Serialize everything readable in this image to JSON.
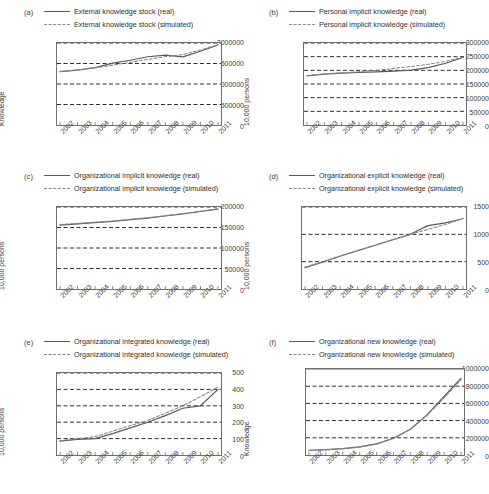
{
  "figure": {
    "panel_count": 6,
    "line_color_real": "#5a5a5a",
    "line_color_simulated": "#8a8a8a",
    "grid_color": "#2f2f2f",
    "axis_color": "#6e6e6e"
  },
  "panels": [
    {
      "label": "(a)",
      "legend": [
        {
          "style": "solid",
          "text": "External knowledge stock (real)"
        },
        {
          "style": "dashed",
          "text": "External knowledge stock (simulated)"
        }
      ],
      "chart_data": {
        "type": "line",
        "title": "External knowledge stock",
        "xlabel": "",
        "ylabel": "Knowledge",
        "x": [
          "2002",
          "2003",
          "2004",
          "2005",
          "2006",
          "2007",
          "2008",
          "2009",
          "2010",
          "2011"
        ],
        "xlim": [
          2002,
          2011
        ],
        "ylim": [
          0,
          2000000
        ],
        "yticks": [
          0,
          500000,
          1000000,
          1500000,
          2000000
        ],
        "ytick_labels": [
          "0",
          "500000",
          "1000000",
          "1500000",
          "2000000"
        ],
        "grid": true,
        "legend_position": "top",
        "series": [
          {
            "name": "External knowledge stock (real)",
            "style": "solid",
            "values": [
              1300000,
              1340000,
              1400000,
              1510000,
              1580000,
              1665000,
              1705000,
              1660000,
              1800000,
              1950000
            ]
          },
          {
            "name": "External knowledge stock (simulated)",
            "style": "dashed",
            "values": [
              1305000,
              1345000,
              1395000,
              1460000,
              1530000,
              1600000,
              1665000,
              1720000,
              1830000,
              1960000
            ]
          }
        ]
      }
    },
    {
      "label": "(b)",
      "legend": [
        {
          "style": "solid",
          "text": "Personal implicit knowledge (real)"
        },
        {
          "style": "dashed",
          "text": "Personal implicit knowledge (simulated)"
        }
      ],
      "chart_data": {
        "type": "line",
        "title": "Personal implicit knowledge",
        "xlabel": "",
        "ylabel": "10,000 persons",
        "x": [
          "2002",
          "2003",
          "2004",
          "2005",
          "2006",
          "2007",
          "2008",
          "2009",
          "2010",
          "2011"
        ],
        "xlim": [
          2002,
          2011
        ],
        "ylim": [
          0,
          300000
        ],
        "yticks": [
          0,
          50000,
          100000,
          150000,
          200000,
          250000,
          300000
        ],
        "ytick_labels": [
          "0",
          "50000",
          "100000",
          "150000",
          "200000",
          "250000",
          "300000"
        ],
        "grid": true,
        "legend_position": "top",
        "series": [
          {
            "name": "Personal implicit knowledge (real)",
            "style": "solid",
            "values": [
              180000,
              186000,
              190000,
              192000,
              194000,
              197000,
              201000,
              210000,
              226000,
              247000
            ]
          },
          {
            "name": "Personal implicit knowledge (simulated)",
            "style": "dashed",
            "values": [
              181000,
              187000,
              191000,
              195000,
              200000,
              207000,
              214000,
              222000,
              233000,
              248000
            ]
          }
        ]
      }
    },
    {
      "label": "(c)",
      "legend": [
        {
          "style": "solid",
          "text": "Organizational implicit knowledge (real)"
        },
        {
          "style": "dashed",
          "text": "Organizational implicit knowledge (simulated)"
        }
      ],
      "chart_data": {
        "type": "line",
        "title": "Organizational implicit knowledge",
        "xlabel": "",
        "ylabel": "10,000 persons",
        "x": [
          "2002",
          "2003",
          "2004",
          "2005",
          "2006",
          "2007",
          "2008",
          "2009",
          "2010",
          "2011"
        ],
        "xlim": [
          2002,
          2011
        ],
        "ylim": [
          0,
          200000
        ],
        "yticks": [
          0,
          50000,
          100000,
          150000,
          200000
        ],
        "ytick_labels": [
          "0",
          "50000",
          "100000",
          "150000",
          "200000"
        ],
        "grid": true,
        "legend_position": "top",
        "series": [
          {
            "name": "Organizational implicit knowledge (real)",
            "style": "solid",
            "values": [
              156000,
              159000,
              162000,
              165000,
              169000,
              173000,
              178000,
              183000,
              189000,
              195000
            ]
          },
          {
            "name": "Organizational implicit knowledge (simulated)",
            "style": "dashed",
            "values": [
              157000,
              160000,
              163000,
              166000,
              170000,
              174000,
              179000,
              184000,
              190000,
              196000
            ]
          }
        ]
      }
    },
    {
      "label": "(d)",
      "legend": [
        {
          "style": "solid",
          "text": "Organizational explicit knowledge (real)"
        },
        {
          "style": "dashed",
          "text": "Organizational explicit knowledge (simulated)"
        }
      ],
      "chart_data": {
        "type": "line",
        "title": "Organizational explicit knowledge",
        "xlabel": "",
        "ylabel": "10,000 persons",
        "x": [
          "2002",
          "2003",
          "2004",
          "2005",
          "2006",
          "2007",
          "2008",
          "2009",
          "2010",
          "2011"
        ],
        "xlim": [
          2002,
          2011
        ],
        "ylim": [
          0,
          1500
        ],
        "yticks": [
          0,
          500,
          1000,
          1500
        ],
        "ytick_labels": [
          "0",
          "500",
          "1000",
          "1500"
        ],
        "grid": true,
        "legend_position": "top",
        "series": [
          {
            "name": "Organizational explicit knowledge (real)",
            "style": "solid",
            "values": [
              390,
              490,
              600,
              700,
              800,
              900,
              1000,
              1160,
              1210,
              1285
            ]
          },
          {
            "name": "Organizational explicit knowledge (simulated)",
            "style": "dashed",
            "values": [
              400,
              500,
              605,
              705,
              805,
              900,
              1000,
              1090,
              1180,
              1290
            ]
          }
        ]
      }
    },
    {
      "label": "(e)",
      "legend": [
        {
          "style": "solid",
          "text": "Organizational integrated knowledge (real)"
        },
        {
          "style": "dashed",
          "text": "Organizational integrated knowledge (simulated)"
        }
      ],
      "chart_data": {
        "type": "line",
        "title": "Organizational integrated knowledge",
        "xlabel": "",
        "ylabel": "10,000 persons",
        "x": [
          "2002",
          "2003",
          "2004",
          "2005",
          "2006",
          "2007",
          "2008",
          "2009",
          "2010",
          "2011"
        ],
        "xlim": [
          2002,
          2011
        ],
        "ylim": [
          0,
          500
        ],
        "yticks": [
          0,
          100,
          200,
          300,
          400,
          500
        ],
        "ytick_labels": [
          "0",
          "100",
          "200",
          "300",
          "400",
          "500"
        ],
        "grid": true,
        "legend_position": "top",
        "series": [
          {
            "name": "Organizational integrated knowledge (real)",
            "style": "solid",
            "values": [
              85,
              95,
              100,
              130,
              165,
              200,
              240,
              285,
              300,
              400
            ]
          },
          {
            "name": "Organizational integrated knowledge (simulated)",
            "style": "dashed",
            "values": [
              88,
              100,
              112,
              145,
              180,
              210,
              255,
              300,
              355,
              415
            ]
          }
        ]
      }
    },
    {
      "label": "(f)",
      "legend": [
        {
          "style": "solid",
          "text": "Organizational new knowledge (real)"
        },
        {
          "style": "dashed",
          "text": "Organizational new knowledge (simulated)"
        }
      ],
      "chart_data": {
        "type": "line",
        "title": "Organizational new knowledge",
        "xlabel": "",
        "ylabel": "Knowledge",
        "x": [
          "2002",
          "2003",
          "2004",
          "2005",
          "2006",
          "2007",
          "2008",
          "2009",
          "2010",
          "2011"
        ],
        "xlim": [
          2002,
          2011
        ],
        "ylim": [
          0,
          1000000
        ],
        "yticks": [
          0,
          200000,
          400000,
          600000,
          800000,
          1000000
        ],
        "ytick_labels": [
          "0",
          "200000",
          "400000",
          "600000",
          "800000",
          "1000000"
        ],
        "grid": true,
        "legend_position": "top",
        "series": [
          {
            "name": "Organizational new knowledge (real)",
            "style": "solid",
            "values": [
              55000,
              62000,
              75000,
              95000,
              130000,
              195000,
              300000,
              470000,
              680000,
              890000
            ]
          },
          {
            "name": "Organizational new knowledge (simulated)",
            "style": "dashed",
            "values": [
              52000,
              60000,
              73000,
              93000,
              128000,
              192000,
              296000,
              462000,
              665000,
              875000
            ]
          }
        ]
      }
    }
  ]
}
